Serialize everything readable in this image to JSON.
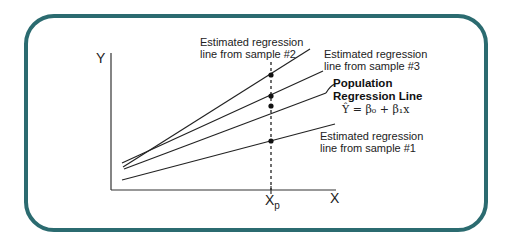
{
  "diagram": {
    "frame_color": "#2b6b70",
    "axes": {
      "y_label": "Y",
      "x_label": "X",
      "x_tick_label": "X",
      "x_tick_subscript": "p"
    },
    "lines": [
      {
        "id": "sample2",
        "label_line1": "Estimated regression",
        "label_line2": "line from sample #2"
      },
      {
        "id": "sample3",
        "label_line1": "Estimated regression",
        "label_line2": "line from sample #3"
      },
      {
        "id": "population",
        "label_line1": "Population",
        "label_line2": "Regression Line"
      },
      {
        "id": "sample1",
        "label_line1": "Estimated regression",
        "label_line2": "line from sample #1"
      }
    ],
    "equation": "Ŷ = β₀ + β₁x"
  }
}
